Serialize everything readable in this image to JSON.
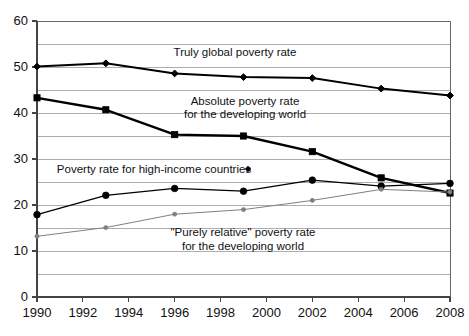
{
  "chart_data": {
    "type": "line",
    "title": "",
    "subtitle": "",
    "xlabel": "",
    "ylabel": "",
    "xlim": [
      1990,
      2008
    ],
    "ylim": [
      0,
      60
    ],
    "grid": true,
    "grid_step": 5,
    "legend_position": "inline-annotations",
    "x": [
      1990,
      1993,
      1996,
      1999,
      2002,
      2005,
      2008
    ],
    "xticks": [
      1990,
      1992,
      1994,
      1996,
      1998,
      2000,
      2002,
      2004,
      2006,
      2008
    ],
    "xticklabels": [
      "1990",
      "1992",
      "1994",
      "1996",
      "1998",
      "2000",
      "2002",
      "2004",
      "2006",
      "2008"
    ],
    "yticks": [
      0,
      10,
      20,
      30,
      40,
      50,
      60
    ],
    "yticklabels": [
      "0",
      "10",
      "20",
      "30",
      "40",
      "50",
      "60"
    ],
    "series": [
      {
        "name": "Truly global poverty rate",
        "marker": "diamond",
        "color": "#000000",
        "line_width": 2,
        "values": [
          50.1,
          50.8,
          48.6,
          47.8,
          47.6,
          45.3,
          43.8
        ]
      },
      {
        "name": "Absolute poverty rate for the developing world",
        "marker": "square",
        "color": "#000000",
        "line_width": 2.4,
        "values": [
          43.3,
          40.7,
          35.3,
          35.0,
          31.6,
          25.9,
          22.6
        ]
      },
      {
        "name": "Poverty rate for high-income countries",
        "marker": "circle",
        "color": "#000000",
        "line_width": 1.3,
        "values": [
          17.9,
          22.1,
          23.6,
          23.0,
          25.4,
          24.1,
          24.7
        ]
      },
      {
        "name": "\"Purely relative\" poverty rate for the developing world",
        "marker": "small-circle",
        "color": "#808080",
        "line_width": 1,
        "values": [
          13.2,
          15.1,
          18.0,
          19.0,
          21.0,
          23.4,
          22.8
        ]
      }
    ],
    "annotations": [
      {
        "id": "truly-global",
        "text": "Truly global poverty rate",
        "x": 235,
        "y": 52
      },
      {
        "id": "absolute-line1",
        "text": "Absolute poverty rate",
        "x": 245,
        "y": 101
      },
      {
        "id": "absolute-line2",
        "text": "for the developing world",
        "x": 245,
        "y": 114
      },
      {
        "id": "high-income",
        "text": "Poverty rate for high-income countries",
        "x": 154,
        "y": 169
      },
      {
        "id": "purely-relative-line1",
        "text": "\"Purely relative\" poverty rate",
        "x": 243,
        "y": 232
      },
      {
        "id": "purely-relative-line2",
        "text": "for the developing world",
        "x": 243,
        "y": 246
      }
    ],
    "pointer_marker": {
      "shape": "diamond",
      "x": 248,
      "y": 169
    }
  },
  "colors": {
    "axis": "#555555",
    "grid": "#999999",
    "border": "#666666",
    "series_dark": "#000000",
    "series_gray": "#808080",
    "background": "#ffffff",
    "text": "#111111"
  }
}
